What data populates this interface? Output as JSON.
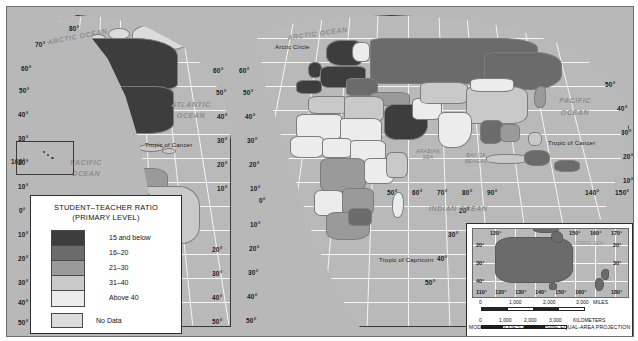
{
  "figure": {
    "kind": "thematic-world-map",
    "projection_note": "MODIFIED GOODE'S HOMOLOSINE EQUAL-AREA PROJECTION"
  },
  "legend": {
    "title_line1": "STUDENT–TEACHER RATIO",
    "title_line2": "(PRIMARY LEVEL)",
    "classes": [
      {
        "label": "15 and below",
        "color": "#3d3d3d"
      },
      {
        "label": "16–20",
        "color": "#6b6b6b"
      },
      {
        "label": "21–30",
        "color": "#9a9a9a"
      },
      {
        "label": "31–40",
        "color": "#c9c9c9"
      },
      {
        "label": "Above 40",
        "color": "#ececec"
      }
    ],
    "nodata": {
      "label": "No Data",
      "color": "#dcdcdc"
    }
  },
  "ocean_labels": {
    "arctic_left": "ARCTIC OCEAN",
    "arctic_right": "ARCTIC OCEAN",
    "atlantic": "ATLANTIC OCEAN",
    "pacific_left": "PACIFIC OCEAN",
    "pacific_right": "PACIFIC OCEAN",
    "indian": "INDIAN OCEAN"
  },
  "sea_labels": {
    "arabian_sea": "ARABIAN SEA",
    "bay_of_bengal": "BAY OF BENGAL",
    "coral_sea": "CORAL SEA"
  },
  "reference_lines": {
    "arctic_circle": "Arctic Circle",
    "tropic_of_cancer_left": "Tropic of Cancer",
    "tropic_of_cancer_right": "Tropic of Cancer",
    "tropic_of_capricorn": "Tropic of Capricorn"
  },
  "latitude_ticks_left": [
    "80°",
    "70°",
    "60°",
    "50°",
    "40°",
    "30°",
    "20°",
    "10°",
    "0°",
    "10°",
    "20°",
    "30°",
    "40°",
    "50°"
  ],
  "latitude_ticks_americas_right": [
    "60°",
    "50°",
    "40°",
    "30°",
    "20°",
    "10°",
    "20°",
    "30°",
    "40°",
    "50°"
  ],
  "latitude_ticks_afroeurasia_left": [
    "60°",
    "50°",
    "40°",
    "30°",
    "20°",
    "10°",
    "0°",
    "10°",
    "20°",
    "30°",
    "40°",
    "50°"
  ],
  "latitude_ticks_right_edge": [
    "50°",
    "40°",
    "30°",
    "20°",
    "10°",
    "20°",
    "30°",
    "40°",
    "50°"
  ],
  "longitude_ticks_bottom": [
    "50°",
    "60°",
    "70°",
    "80°",
    "90°",
    "140°",
    "150°"
  ],
  "hawaii_inset": {
    "label": "160°"
  },
  "inset": {
    "name": "australia-new-zealand-inset",
    "lon_top": [
      "120°",
      "150°",
      "160°",
      "170°"
    ],
    "lon_bottom": [
      "110°",
      "120°",
      "130°",
      "140°",
      "150°",
      "160°",
      "180°"
    ],
    "lat_left": [
      "20°",
      "30°",
      "40°"
    ],
    "lat_right": [
      "20°",
      "30°"
    ],
    "scale_miles": {
      "ticks": [
        "0",
        "1,000",
        "2,000",
        "3,000"
      ],
      "unit": "MILES"
    },
    "scale_km": {
      "ticks": [
        "0",
        "1,000",
        "2,000",
        "3,000"
      ],
      "unit": "KILOMETERS"
    }
  }
}
